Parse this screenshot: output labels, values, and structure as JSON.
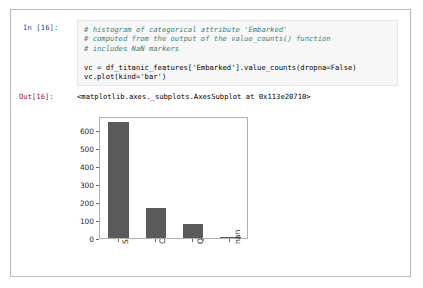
{
  "notebook": {
    "input_cell": {
      "prompt": "In [16]:",
      "lines": [
        {
          "type": "comment",
          "text": "# histogram of categorical attribute 'Embarked'"
        },
        {
          "type": "comment",
          "text": "# computed from the output of the value_counts() function"
        },
        {
          "type": "comment",
          "text": "# includes NaN markers"
        },
        {
          "type": "blank",
          "text": ""
        },
        {
          "type": "code",
          "text": "vc = df_titanic_features['Embarked'].value_counts(dropna=False)"
        },
        {
          "type": "code",
          "text": "vc.plot(kind='bar')"
        }
      ]
    },
    "output_cell": {
      "prompt": "Out[16]:",
      "repr": "<matplotlib.axes._subplots.AxesSubplot at 0x113e20710>"
    }
  },
  "chart_data": {
    "type": "bar",
    "title": "",
    "xlabel": "",
    "ylabel": "",
    "categories": [
      "S",
      "C",
      "Q",
      "nan"
    ],
    "values": [
      644,
      168,
      77,
      2
    ],
    "ylim": [
      0,
      680
    ],
    "yticks": [
      0,
      100,
      200,
      300,
      400,
      500,
      600
    ],
    "ytick_labels": [
      "0",
      "100",
      "200",
      "300",
      "400",
      "500",
      "600"
    ],
    "grid": false,
    "legend": false,
    "bar_color": "#5a5a5a",
    "axes_color": "#b0b0b0",
    "tick_label_rotation": 90
  },
  "colors": {
    "bar": "#5a5a5a",
    "code_background": "#f7f7f7",
    "code_border": "#e6e6e6",
    "in_prompt": "#303f9f",
    "out_prompt": "#a31515",
    "comment": "#408080",
    "string": "#ba2121",
    "frame_border": "#b9b9b9"
  }
}
